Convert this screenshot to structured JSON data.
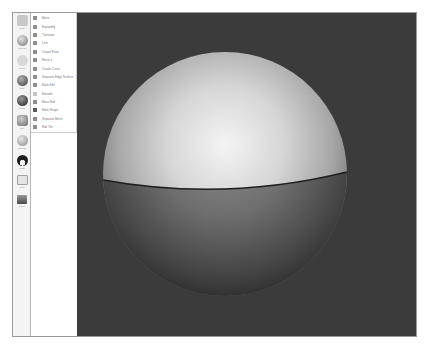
{
  "toolbar": {
    "tools": [
      {
        "label": "Create",
        "icon": "plus-icon",
        "color": "#c8c8c8"
      },
      {
        "label": "Modeling",
        "icon": "sphere-tool-icon",
        "color": "#8a8a8a"
      },
      {
        "label": "Curves",
        "icon": "curve-icon",
        "color": "#bdbdbd"
      },
      {
        "label": "Paint",
        "icon": "brush-icon",
        "color": "#6a6a6a"
      },
      {
        "label": "Deform",
        "icon": "globe-icon",
        "color": "#4a4a4a"
      },
      {
        "label": "Edit",
        "icon": "cup-icon",
        "color": "#a0a0a0"
      },
      {
        "label": "Materials",
        "icon": "material-ball-icon",
        "color": "#b0b0b0"
      },
      {
        "label": "Lights",
        "icon": "light-icon",
        "color": "#2e2e2e"
      },
      {
        "label": "Mask",
        "icon": "box-icon",
        "color": "#d6d6d6"
      },
      {
        "label": "Render",
        "icon": "render-icon",
        "color": "#707070"
      }
    ]
  },
  "menu": {
    "items": [
      {
        "label": "Move"
      },
      {
        "label": "Expandify"
      },
      {
        "label": "Translate"
      },
      {
        "label": "Line"
      },
      {
        "label": "Create Point"
      },
      {
        "label": "Mirror it"
      },
      {
        "label": "Create Curve"
      },
      {
        "label": "Separate Edge Surface"
      },
      {
        "label": "Mark Edit"
      },
      {
        "label": "Extrude"
      },
      {
        "label": "Mass Edit"
      },
      {
        "label": "Mark Shape"
      },
      {
        "label": "Separate Mesh"
      },
      {
        "label": "Edit Tile"
      }
    ]
  },
  "viewport": {
    "background": "#3b3b3b",
    "object": "sphere"
  }
}
